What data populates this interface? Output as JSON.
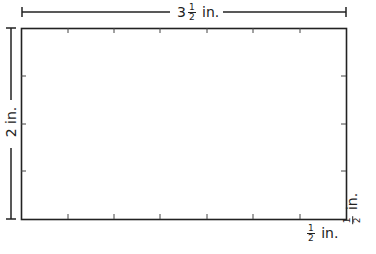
{
  "diagram": {
    "shape": "rectangle",
    "width_label": {
      "whole": "3",
      "num": "1",
      "den": "2",
      "unit": "in."
    },
    "height_label": {
      "text": "2 in."
    },
    "unit_square_label_horizontal": {
      "num": "1",
      "den": "2",
      "unit": "in."
    },
    "unit_square_label_vertical": {
      "num": "1",
      "den": "2",
      "unit": "in."
    },
    "tick_count_horizontal": 6,
    "tick_count_vertical": 3,
    "line_color": "#222222"
  }
}
